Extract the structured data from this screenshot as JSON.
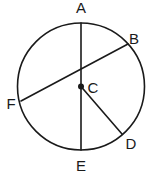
{
  "figure": {
    "background_color": "#ffffff",
    "stroke_color": "#1a1a1a",
    "canvas": {
      "width": 149,
      "height": 182
    },
    "circle": {
      "cx": 81,
      "cy": 86.5,
      "r": 63.5
    },
    "center_point": {
      "id": "C",
      "x": 81,
      "y": 86.5,
      "dot_radius": 3
    },
    "points": [
      {
        "id": "A",
        "label": "A",
        "on_circle_x": 81,
        "on_circle_y": 23,
        "label_x": 81,
        "label_y": 9
      },
      {
        "id": "B",
        "label": "B",
        "on_circle_x": 128,
        "on_circle_y": 44,
        "label_x": 134,
        "label_y": 40
      },
      {
        "id": "C",
        "label": "C",
        "on_circle_x": 81,
        "on_circle_y": 86.5,
        "label_x": 93,
        "label_y": 89
      },
      {
        "id": "D",
        "label": "D",
        "on_circle_x": 122,
        "on_circle_y": 134,
        "label_x": 131,
        "label_y": 145
      },
      {
        "id": "E",
        "label": "E",
        "on_circle_x": 81,
        "on_circle_y": 150,
        "label_x": 81,
        "label_y": 167
      },
      {
        "id": "F",
        "label": "F",
        "on_circle_x": 21,
        "on_circle_y": 101,
        "label_x": 11,
        "label_y": 105
      }
    ],
    "segments": [
      {
        "id": "AE",
        "kind": "diameter",
        "from": "A",
        "to": "E",
        "x1": 81,
        "y1": 23,
        "x2": 81,
        "y2": 150
      },
      {
        "id": "FB",
        "kind": "diameter",
        "from": "F",
        "to": "B",
        "x1": 21,
        "y1": 101,
        "x2": 128,
        "y2": 44
      },
      {
        "id": "CD",
        "kind": "radius",
        "from": "C",
        "to": "D",
        "x1": 81,
        "y1": 86.5,
        "x2": 122,
        "y2": 134
      }
    ],
    "labels": {
      "A": "A",
      "B": "B",
      "C": "C",
      "D": "D",
      "E": "E",
      "F": "F"
    }
  }
}
